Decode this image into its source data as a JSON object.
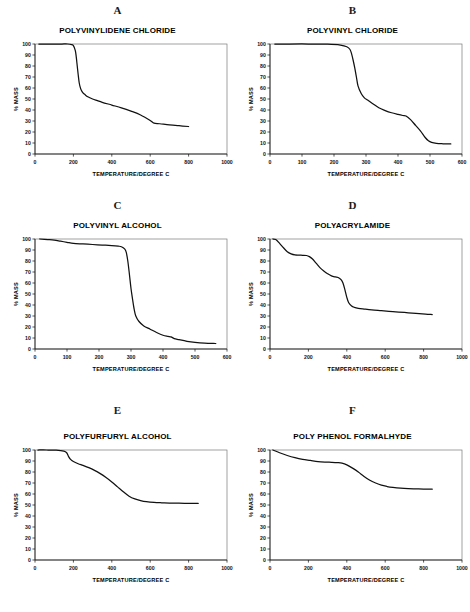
{
  "figure": {
    "background": "#ffffff",
    "curve_color": "#111111",
    "frame_color": "#7a7a7a",
    "axis_color": "#111111"
  },
  "panels": [
    {
      "letter": "A",
      "title": "POLYVINYLIDENE CHLORIDE",
      "xlabel": "TEMPERATURE/DEGREE C",
      "ylabel": "% MASS"
    },
    {
      "letter": "B",
      "title": "POLYVINYL CHLORIDE",
      "xlabel": "TEMPERATURE/DEGREE C",
      "ylabel": "% MASS"
    },
    {
      "letter": "C",
      "title": "POLYVINYL ALCOHOL",
      "xlabel": "TEMPERATURE/DEGREE C",
      "ylabel": "% MASS"
    },
    {
      "letter": "D",
      "title": "POLYACRYLAMIDE",
      "xlabel": "TEMPERATURE/DEGREE C",
      "ylabel": "% MASS"
    },
    {
      "letter": "E",
      "title": "POLYFURFURYL ALCOHOL",
      "xlabel": "TEMPERATURE/DEGREE C",
      "ylabel": "% MASS"
    },
    {
      "letter": "F",
      "title": "POLY PHENOL FORMALHYDE",
      "xlabel": "TEMPERATURE/DEGREE C",
      "ylabel": "% MASS"
    }
  ],
  "chart_data": [
    {
      "type": "line",
      "panel": "A",
      "title": "POLYVINYLIDENE CHLORIDE",
      "xlabel": "TEMPERATURE/DEGREE C",
      "ylabel": "% MASS",
      "xlim": [
        0,
        1000
      ],
      "ylim": [
        0,
        100
      ],
      "xticks": [
        0,
        200,
        400,
        600,
        800,
        1000
      ],
      "yticks": [
        0,
        10,
        20,
        30,
        40,
        50,
        60,
        70,
        80,
        90,
        100
      ],
      "grid": false,
      "legend": "none",
      "x": [
        20,
        60,
        100,
        140,
        170,
        190,
        200,
        210,
        215,
        220,
        225,
        230,
        235,
        240,
        250,
        260,
        275,
        300,
        325,
        350,
        400,
        450,
        500,
        550,
        600,
        620,
        650,
        700,
        750,
        800
      ],
      "y": [
        100,
        100,
        100,
        100,
        100,
        99.5,
        98.5,
        94,
        88,
        80,
        72,
        65,
        61,
        58.5,
        55.5,
        54,
        52,
        50,
        48.5,
        47,
        44.5,
        42,
        39,
        35.5,
        30.5,
        28,
        27.5,
        26.5,
        25.7,
        25
      ]
    },
    {
      "type": "line",
      "panel": "B",
      "title": "POLYVINYL CHLORIDE",
      "xlabel": "TEMPERATURE/DEGREE C",
      "ylabel": "% MASS",
      "xlim": [
        0,
        600
      ],
      "ylim": [
        0,
        100
      ],
      "xticks": [
        0,
        100,
        200,
        300,
        400,
        500,
        600
      ],
      "yticks": [
        0,
        10,
        20,
        30,
        40,
        50,
        60,
        70,
        80,
        90,
        100
      ],
      "grid": false,
      "legend": "none",
      "x": [
        15,
        60,
        120,
        180,
        220,
        240,
        250,
        255,
        260,
        265,
        270,
        275,
        285,
        295,
        305,
        320,
        340,
        360,
        380,
        400,
        415,
        425,
        440,
        455,
        470,
        485,
        495,
        505,
        520,
        540,
        565
      ],
      "y": [
        100,
        100,
        100,
        99.8,
        99,
        97.5,
        95,
        91,
        85,
        78,
        70,
        62,
        55,
        51,
        49,
        46,
        42,
        39.5,
        37.5,
        36,
        35,
        34.5,
        31,
        26,
        21,
        15,
        12,
        10.5,
        9.6,
        9.3,
        9.2
      ]
    },
    {
      "type": "line",
      "panel": "C",
      "title": "POLYVINYL ALCOHOL",
      "xlabel": "TEMPERATURE/DEGREE C",
      "ylabel": "% MASS",
      "xlim": [
        0,
        600
      ],
      "ylim": [
        0,
        100
      ],
      "xticks": [
        0,
        100,
        200,
        300,
        400,
        500,
        600
      ],
      "yticks": [
        0,
        10,
        20,
        30,
        40,
        50,
        60,
        70,
        80,
        90,
        100
      ],
      "grid": false,
      "legend": "none",
      "x": [
        15,
        40,
        60,
        80,
        100,
        120,
        150,
        180,
        210,
        240,
        260,
        270,
        280,
        285,
        290,
        295,
        300,
        305,
        310,
        315,
        325,
        340,
        360,
        380,
        400,
        415,
        425,
        435,
        450,
        475,
        500,
        530,
        565
      ],
      "y": [
        100,
        99.5,
        99,
        98,
        97,
        96,
        95.5,
        95,
        94.5,
        94,
        93.5,
        93,
        91,
        88,
        80,
        68,
        55,
        45,
        36,
        30,
        25,
        21,
        18,
        15,
        12.5,
        11.5,
        11,
        9.5,
        8.5,
        7,
        6,
        5.3,
        5
      ]
    },
    {
      "type": "line",
      "panel": "D",
      "title": "POLYACRYLAMIDE",
      "xlabel": "TEMPERATURE/DEGREE C",
      "ylabel": "% MASS",
      "xlim": [
        0,
        1000
      ],
      "ylim": [
        0,
        100
      ],
      "xticks": [
        0,
        200,
        400,
        600,
        800,
        1000
      ],
      "yticks": [
        0,
        10,
        20,
        30,
        40,
        50,
        60,
        70,
        80,
        90,
        100
      ],
      "grid": false,
      "legend": "none",
      "x": [
        15,
        30,
        50,
        70,
        90,
        110,
        130,
        150,
        170,
        190,
        205,
        220,
        240,
        260,
        280,
        300,
        320,
        340,
        355,
        370,
        380,
        390,
        400,
        410,
        425,
        440,
        460,
        490,
        530,
        580,
        640,
        700,
        760,
        810,
        845
      ],
      "y": [
        100,
        99.5,
        96,
        92,
        88.5,
        86.5,
        85.5,
        85.3,
        85.2,
        85,
        84,
        82,
        78,
        74,
        71,
        68.5,
        66.5,
        65.5,
        65,
        63,
        60,
        54,
        47,
        42,
        39,
        37.8,
        37,
        36.3,
        35.5,
        34.8,
        34,
        33.2,
        32.4,
        31.8,
        31.3
      ]
    },
    {
      "type": "line",
      "panel": "E",
      "title": "POLYFURFURYL ALCOHOL",
      "xlabel": "TEMPERATURE/DEGREE C",
      "ylabel": "% MASS",
      "xlim": [
        0,
        1000
      ],
      "ylim": [
        0,
        100
      ],
      "xticks": [
        0,
        200,
        400,
        600,
        800,
        1000
      ],
      "yticks": [
        0,
        10,
        20,
        30,
        40,
        50,
        60,
        70,
        80,
        90,
        100
      ],
      "grid": false,
      "legend": "none",
      "x": [
        15,
        60,
        110,
        150,
        165,
        175,
        185,
        200,
        225,
        250,
        280,
        310,
        340,
        370,
        400,
        430,
        460,
        490,
        520,
        550,
        580,
        620,
        660,
        700,
        750,
        800,
        850
      ],
      "y": [
        100,
        100,
        99.8,
        99,
        97.5,
        94,
        91.5,
        89.5,
        87.5,
        86,
        84,
        81.5,
        78.5,
        75,
        71,
        66.5,
        62,
        58,
        55.5,
        54,
        53,
        52.3,
        52,
        51.8,
        51.6,
        51.5,
        51.4
      ]
    },
    {
      "type": "line",
      "panel": "F",
      "title": "POLY PHENOL FORMALHYDE",
      "xlabel": "TEMPERATURE/DEGREE C",
      "ylabel": "% MASS",
      "xlim": [
        0,
        1000
      ],
      "ylim": [
        0,
        100
      ],
      "xticks": [
        0,
        200,
        400,
        600,
        800,
        1000
      ],
      "yticks": [
        0,
        10,
        20,
        30,
        40,
        50,
        60,
        70,
        80,
        90,
        100
      ],
      "grid": false,
      "legend": "none",
      "x": [
        15,
        50,
        90,
        130,
        170,
        210,
        250,
        290,
        320,
        350,
        375,
        400,
        430,
        460,
        490,
        520,
        550,
        580,
        610,
        640,
        680,
        720,
        760,
        800,
        845
      ],
      "y": [
        100,
        97.5,
        95,
        93,
        91.5,
        90.5,
        89.5,
        89,
        88.8,
        88.5,
        88,
        86.5,
        83.5,
        80,
        76,
        72.5,
        70,
        68,
        66.8,
        66,
        65.3,
        64.9,
        64.7,
        64.5,
        64.4
      ]
    }
  ]
}
